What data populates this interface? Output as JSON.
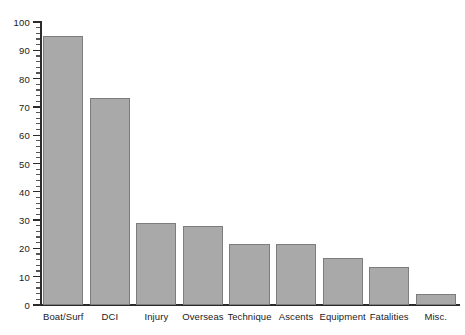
{
  "chart_data": {
    "type": "bar",
    "title": "",
    "subtitle": "",
    "xlabel": "",
    "ylabel": "",
    "categories": [
      "Boat/Surf",
      "DCI",
      "Injury",
      "Overseas",
      "Technique",
      "Ascents",
      "Equipment",
      "Fatalities",
      "Misc."
    ],
    "values": [
      95,
      73,
      29,
      28,
      21.5,
      21.5,
      16.5,
      13.5,
      4
    ],
    "ylim": [
      0,
      100
    ],
    "xlim_note": "categorical",
    "y_major_tick_step": 10,
    "y_minor_tick_step": 2,
    "y_tick_labels": [
      "0",
      "10",
      "20",
      "30",
      "40",
      "50",
      "60",
      "70",
      "80",
      "90",
      "100"
    ],
    "y_tick_values": [
      0,
      10,
      20,
      30,
      40,
      50,
      60,
      70,
      80,
      90,
      100
    ],
    "grid": false,
    "legend": null,
    "legend_position": "none",
    "annotations": [],
    "orientation": "vertical",
    "series": [
      {
        "name": "Count",
        "values": [
          95,
          73,
          29,
          28,
          21.5,
          21.5,
          16.5,
          13.5,
          4
        ]
      }
    ]
  },
  "style": {
    "background_color": "#ffffff",
    "bar_fill_color": "#a9a9a9",
    "bar_border_color": "#7d7d7d",
    "axis_color": "#2b2b2b",
    "tick_label_color": "#1a1a1a"
  }
}
